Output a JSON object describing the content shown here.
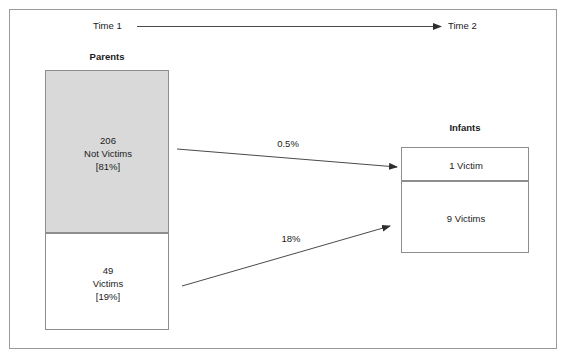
{
  "figure": {
    "timeline": {
      "start_label": "Time 1",
      "end_label": "Time 2"
    },
    "groups": [
      {
        "title": "Parents",
        "boxes": [
          {
            "count": "206",
            "category": "Not Victims",
            "percent": "[81%]"
          },
          {
            "count": "49",
            "category": "Victims",
            "percent": "[19%]"
          }
        ]
      },
      {
        "title": "Infants",
        "boxes": [
          {
            "label": "1 Victim"
          },
          {
            "label": "9 Victims"
          }
        ]
      }
    ],
    "flows": [
      {
        "from": "parents-not-victims",
        "to": "infants-one-victim",
        "rate": "0.5%"
      },
      {
        "from": "parents-victims",
        "to": "infants-nine-victims",
        "rate": "18%"
      }
    ],
    "colors": {
      "shaded_box_fill": "#d9d9d9",
      "plain_box_fill": "#ffffff",
      "box_border": "#8d8d8d",
      "frame_border": "#9a9a9a",
      "text": "#1b1b1b",
      "arrow": "#3a3a3a"
    }
  }
}
